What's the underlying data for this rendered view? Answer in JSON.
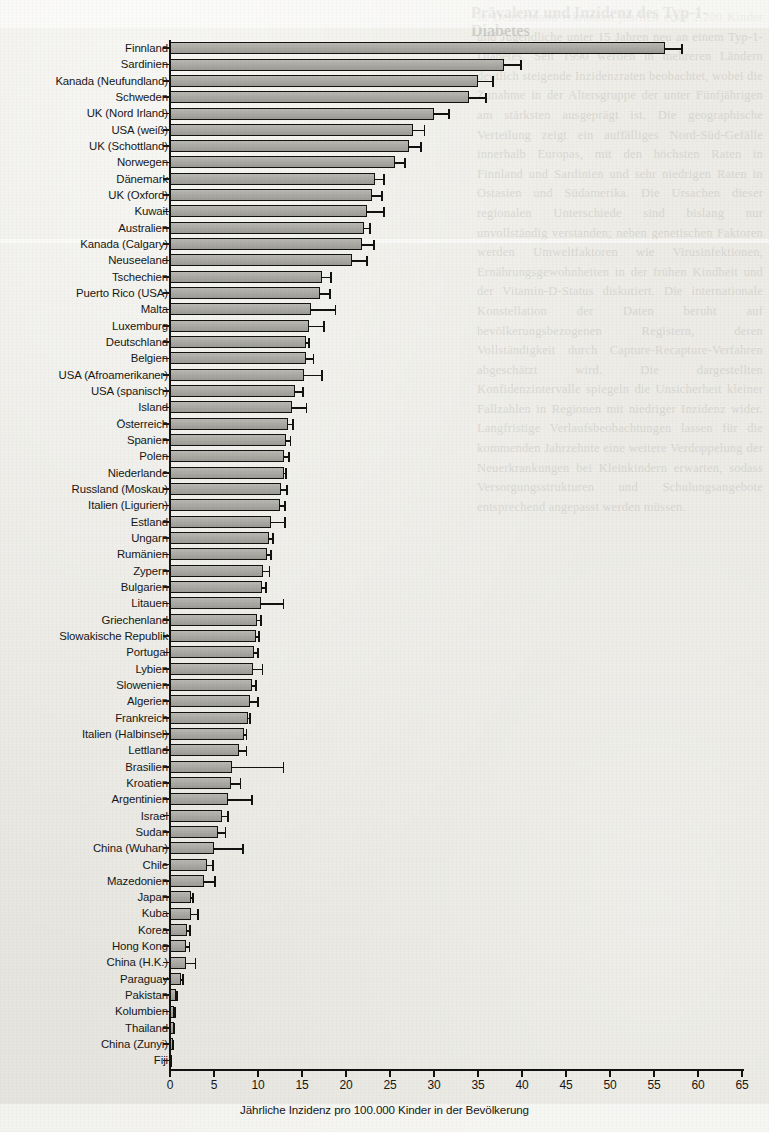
{
  "page": {
    "language": "de",
    "bleed_title": "Prävalenz und Inzidenz des Typ-1-Diabetes",
    "bleed_text": "In Deutschland erkranken jährlich etwa 2.200 Kinder und Jugendliche unter 15 Jahren neu an einem Typ-1-Diabetes. Seit 1990 werden in mehreren Ländern deutlich steigende Inzidenzraten beobachtet, wobei die Zunahme in der Altersgruppe der unter Fünfjährigen am stärksten ausgeprägt ist. Die geographische Verteilung zeigt ein auffälliges Nord-Süd-Gefälle innerhalb Europas, mit den höchsten Raten in Finnland und Sardinien und sehr niedrigen Raten in Ostasien und Südamerika. Die Ursachen dieser regionalen Unterschiede sind bislang nur unvollständig verstanden; neben genetischen Faktoren werden Umweltfaktoren wie Virusinfektionen, Ernährungsgewohnheiten in der frühen Kindheit und der Vitamin-D-Status diskutiert. Die internationale Konstellation der Daten beruht auf bevölkerungsbezogenen Registern, deren Vollständigkeit durch Capture-Recapture-Verfahren abgeschätzt wird. Die dargestellten Konfidenzintervalle spiegeln die Unsicherheit kleiner Fallzahlen in Regionen mit niedriger Inzidenz wider. Langfristige Verlaufsbeobachtungen lassen für die kommenden Jahrzehnte eine weitere Verdoppelung der Neuerkrankungen bei Kleinkindern erwarten, sodass Versorgungsstrukturen und Schulungsangebote entsprechend angepasst werden müssen."
  },
  "chart_data": {
    "type": "bar",
    "orientation": "horizontal",
    "title": "",
    "xlabel": "Jährliche Inzidenz pro 100.000 Kinder in der Bevölkerung",
    "ylabel": "",
    "xlim": [
      0,
      65
    ],
    "xticks": [
      0,
      5,
      10,
      15,
      20,
      25,
      30,
      35,
      40,
      45,
      50,
      55,
      60,
      65
    ],
    "grid": false,
    "legend": null,
    "error_bars": "upper 95% confidence limit shown",
    "bar_color": "#aeada8",
    "bar_edge_color": "#121211",
    "categories": [
      "Finnland",
      "Sardinien",
      "Kanada (Neufundland)",
      "Schweden",
      "UK (Nord Irland)",
      "USA (weiß)",
      "UK (Schottland)",
      "Norwegen",
      "Dänemark",
      "UK (Oxford)",
      "Kuwait",
      "Australien",
      "Kanada (Calgary)",
      "Neuseeland",
      "Tschechien",
      "Puerto Rico (USA)",
      "Malta",
      "Luxemburg",
      "Deutschland",
      "Belgien",
      "USA (Afroamerikaner)",
      "USA (spanisch)",
      "Island",
      "Österreich",
      "Spanien",
      "Polen",
      "Niederlande",
      "Russland (Moskau)",
      "Italien (Ligurien)",
      "Estland",
      "Ungarn",
      "Rumänien",
      "Zypern",
      "Bulgarien",
      "Litauen",
      "Griechenland",
      "Slowakische Republik",
      "Portugal",
      "Lybien",
      "Slowenien",
      "Algerien",
      "Frankreich",
      "Italien (Halbinsel)",
      "Lettland",
      "Brasilien",
      "Kroatien",
      "Argentinien",
      "Israel",
      "Sudan",
      "China (Wuhan)",
      "Chile",
      "Mazedonien",
      "Japan",
      "Kuba",
      "Korea",
      "Hong Kong",
      "China (H.K.)",
      "Paraguay",
      "Pakistan",
      "Kolumbien",
      "Thailand",
      "China (Zunyi)",
      "Fiji"
    ],
    "values": [
      56.3,
      38.0,
      35.0,
      34.0,
      30.0,
      27.6,
      27.2,
      25.6,
      23.3,
      23.0,
      22.4,
      22.0,
      21.8,
      20.7,
      17.3,
      17.0,
      16.0,
      15.8,
      15.5,
      15.4,
      15.2,
      14.2,
      13.9,
      13.4,
      13.2,
      13.0,
      12.9,
      12.6,
      12.5,
      11.5,
      11.2,
      11.0,
      10.6,
      10.5,
      10.3,
      9.9,
      9.8,
      9.6,
      9.4,
      9.3,
      9.1,
      8.9,
      8.4,
      7.8,
      7.0,
      6.9,
      6.6,
      5.9,
      5.4,
      5.0,
      4.2,
      3.9,
      2.4,
      2.4,
      1.9,
      1.8,
      1.8,
      1.3,
      0.7,
      0.5,
      0.4,
      0.3,
      0.2
    ],
    "error_upper": [
      58.3,
      40.0,
      36.8,
      36.0,
      31.8,
      29.0,
      28.6,
      26.8,
      24.4,
      24.2,
      24.4,
      22.8,
      23.3,
      22.5,
      18.4,
      18.3,
      18.9,
      17.6,
      15.9,
      16.4,
      17.4,
      15.2,
      15.6,
      14.1,
      13.8,
      13.6,
      13.3,
      13.4,
      13.2,
      13.2,
      11.8,
      11.6,
      11.4,
      11.0,
      13.0,
      10.4,
      10.2,
      10.1,
      10.6,
      9.9,
      10.1,
      9.2,
      8.8,
      8.8,
      13.0,
      8.1,
      9.4,
      6.7,
      6.4,
      8.4,
      5.0,
      5.2,
      2.7,
      3.3,
      2.4,
      2.3,
      3.0,
      1.6,
      0.9,
      0.7,
      0.6,
      0.5,
      0.3
    ]
  }
}
